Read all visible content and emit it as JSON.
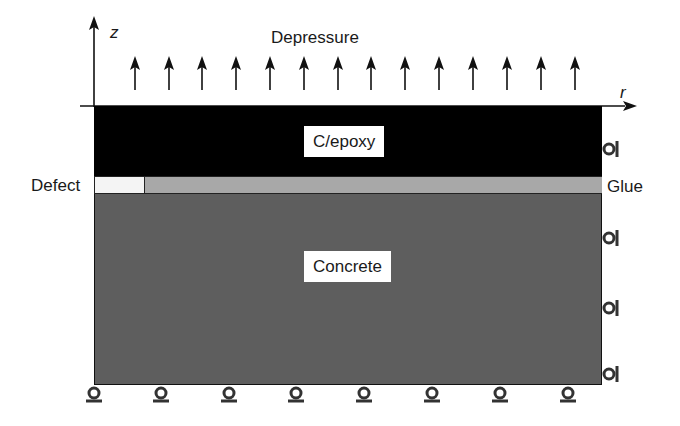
{
  "diagram": {
    "axes": {
      "vertical_label": "z",
      "horizontal_label": "r"
    },
    "load": {
      "label": "Depressure",
      "arrow_count": 14,
      "direction": "up"
    },
    "layers": [
      {
        "name": "C/epoxy",
        "color": "#000000"
      },
      {
        "name": "Glue",
        "color": "#a8a8a8"
      },
      {
        "name": "Concrete",
        "color": "#5e5e5e"
      }
    ],
    "defect": {
      "label": "Defect",
      "color": "#f4f4f4"
    },
    "supports": {
      "bottom_roller_count": 8,
      "right_roller_count": 4
    },
    "labels": {
      "c_epoxy": "C/epoxy",
      "concrete": "Concrete",
      "glue": "Glue",
      "defect": "Defect",
      "depressure": "Depressure",
      "z": "z",
      "r": "r"
    }
  }
}
